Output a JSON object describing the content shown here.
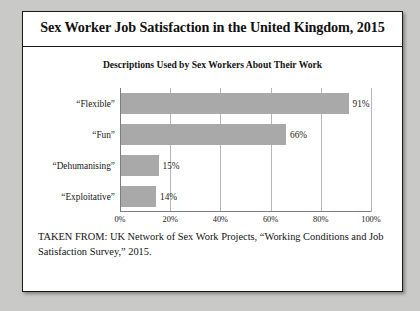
{
  "figure": {
    "title": "Sex Worker Job Satisfaction in the United Kingdom, 2015",
    "caption": "TAKEN FROM: UK Network of Sex Work Projects, “Working Conditions and Job Satisfaction Survey,” 2015."
  },
  "chart_data": {
    "type": "bar",
    "orientation": "horizontal",
    "title": "Descriptions Used by Sex Workers About Their Work",
    "xlabel": "",
    "ylabel": "",
    "categories": [
      "“Flexible”",
      "“Fun”",
      "“Dehumanising”",
      "“Exploitative”"
    ],
    "values": [
      91,
      66,
      15,
      14
    ],
    "value_labels": [
      "91%",
      "66%",
      "15%",
      "14%"
    ],
    "xlim": [
      0,
      100
    ],
    "xticks": [
      0,
      20,
      40,
      60,
      80,
      100
    ],
    "xtick_labels": [
      "0%",
      "20%",
      "40%",
      "60%",
      "80%",
      "100%"
    ],
    "grid": "vertical",
    "legend": "none",
    "bar_color": "#a9a9a9",
    "gridline_color": "#b6b6b6",
    "axis_color": "#7d7d7d"
  }
}
